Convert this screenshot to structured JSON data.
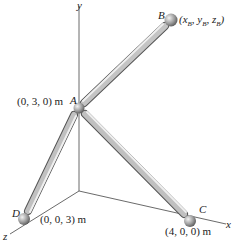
{
  "axes": {
    "x": "x",
    "y": "y",
    "z": "z"
  },
  "points": {
    "A": {
      "name": "A",
      "coord": "(0, 3, 0) m"
    },
    "B": {
      "name": "B",
      "coord": "(x_B, y_B, z_B)"
    },
    "C": {
      "name": "C",
      "coord": "(4, 0, 0) m"
    },
    "D": {
      "name": "D",
      "coord": "(0, 0, 3) m"
    }
  },
  "members": [
    "AB",
    "AC",
    "AD"
  ],
  "colors": {
    "axis": "#444444",
    "rod": "#a8a8a8",
    "rod_dark": "#6a6a6a",
    "ball": "#9a9a9a"
  }
}
